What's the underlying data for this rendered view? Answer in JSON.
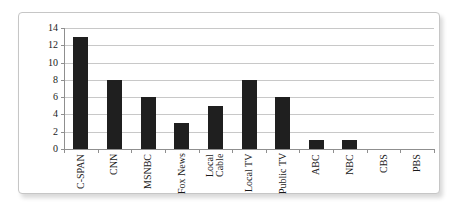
{
  "chart_data": {
    "type": "bar",
    "title": "",
    "xlabel": "",
    "ylabel": "",
    "categories": [
      "C-SPAN",
      "CNN",
      "MSNBC",
      "Fox News",
      "Local Cable",
      "Local TV",
      "Public TV",
      "ABC",
      "NBC",
      "CBS",
      "PBS"
    ],
    "label_lines": [
      [
        "C-SPAN"
      ],
      [
        "CNN"
      ],
      [
        "MSNBC"
      ],
      [
        "Fox News"
      ],
      [
        "Local",
        "Cable"
      ],
      [
        "Local TV"
      ],
      [
        "Public TV"
      ],
      [
        "ABC"
      ],
      [
        "NBC"
      ],
      [
        "CBS"
      ],
      [
        "PBS"
      ]
    ],
    "values": [
      13,
      8,
      6,
      3,
      5,
      8,
      6,
      1,
      1,
      0,
      0
    ],
    "y_ticks": [
      0,
      2,
      4,
      6,
      8,
      10,
      12,
      14
    ],
    "ylim": [
      0,
      14
    ],
    "grid": true,
    "legend_position": "none",
    "bar_color": "#1f1f1f",
    "gridline_color": "#c8c8c8",
    "axis_color": "#8f8f8f",
    "panel_border_color": "#c6c6c6",
    "background_color": "#ffffff",
    "label_color": "#1a1a1a"
  }
}
